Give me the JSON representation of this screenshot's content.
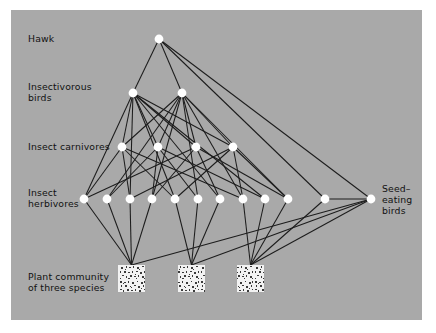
{
  "figure": {
    "type": "food-web-diagram",
    "background_color": "#a9a9a9",
    "page_background": "#ffffff",
    "node_color": "#ffffff",
    "edge_color": "#1c1c1c",
    "text_color": "#111111"
  },
  "labels": {
    "hawk": "Hawk",
    "insectivorous_birds_line1": "Insectivorous",
    "insectivorous_birds_line2": "birds",
    "insect_carnivores": "Insect carnivores",
    "insect_herbivores_line1": "Insect",
    "insect_herbivores_line2": "herbivores",
    "plant_community_line1": "Plant community",
    "plant_community_line2": "of three species",
    "seed_eating_birds_line1": "Seed–",
    "seed_eating_birds_line2": "eating",
    "seed_eating_birds_line3": "birds"
  },
  "trophic_levels": [
    {
      "id": "hawk",
      "label": "Hawk",
      "node_count": 1,
      "y": 29
    },
    {
      "id": "insectivorous-birds",
      "label": "Insectivorous birds",
      "node_count": 2,
      "y": 83
    },
    {
      "id": "insect-carnivores",
      "label": "Insect carnivores",
      "node_count": 4,
      "y": 137
    },
    {
      "id": "insect-herbivores",
      "label": "Insect herbivores",
      "node_count": 12,
      "y": 189
    },
    {
      "id": "seed-eating-birds",
      "label": "Seed-eating birds",
      "node_count": 1,
      "y": 189
    },
    {
      "id": "plant-community",
      "label": "Plant community of three species",
      "node_count": 3,
      "y": 266
    }
  ],
  "nodes": {
    "hawk": [
      {
        "id": "H1",
        "x": 148,
        "y": 29
      }
    ],
    "insectivorous_birds": [
      {
        "id": "IB1",
        "x": 122,
        "y": 83
      },
      {
        "id": "IB2",
        "x": 171,
        "y": 83
      }
    ],
    "insect_carnivores": [
      {
        "id": "C1",
        "x": 111,
        "y": 137
      },
      {
        "id": "C2",
        "x": 147,
        "y": 137
      },
      {
        "id": "C3",
        "x": 185,
        "y": 137
      },
      {
        "id": "C4",
        "x": 222,
        "y": 137
      }
    ],
    "insect_herbivores": [
      {
        "id": "Hb1",
        "x": 73,
        "y": 189
      },
      {
        "id": "Hb2",
        "x": 96,
        "y": 189
      },
      {
        "id": "Hb3",
        "x": 119,
        "y": 189
      },
      {
        "id": "Hb4",
        "x": 141,
        "y": 189
      },
      {
        "id": "Hb5",
        "x": 164,
        "y": 189
      },
      {
        "id": "Hb6",
        "x": 187,
        "y": 189
      },
      {
        "id": "Hb7",
        "x": 209,
        "y": 189
      },
      {
        "id": "Hb8",
        "x": 232,
        "y": 189
      },
      {
        "id": "Hb9",
        "x": 254,
        "y": 189
      },
      {
        "id": "Hb10",
        "x": 277,
        "y": 189
      },
      {
        "id": "Hb11",
        "x": 314,
        "y": 189
      }
    ],
    "seed_eating_birds": [
      {
        "id": "SB1",
        "x": 360,
        "y": 189
      }
    ],
    "plant_patches": [
      {
        "id": "P1",
        "x": 107,
        "y": 255,
        "width": 27,
        "height": 27
      },
      {
        "id": "P2",
        "x": 167,
        "y": 255,
        "width": 27,
        "height": 27
      },
      {
        "id": "P3",
        "x": 226,
        "y": 255,
        "width": 27,
        "height": 27
      }
    ]
  },
  "edges": {
    "hawk_to_birds": [
      [
        "H1",
        "IB1"
      ],
      [
        "H1",
        "IB2"
      ]
    ],
    "hawk_to_others": [
      [
        "H1",
        "Hb11"
      ],
      [
        "H1",
        "SB1"
      ]
    ],
    "birds_to_carnivores": [
      [
        "IB1",
        "C1"
      ],
      [
        "IB1",
        "C2"
      ],
      [
        "IB1",
        "C3"
      ],
      [
        "IB1",
        "C4"
      ],
      [
        "IB2",
        "C1"
      ],
      [
        "IB2",
        "C2"
      ],
      [
        "IB2",
        "C3"
      ],
      [
        "IB2",
        "C4"
      ]
    ],
    "birds_to_herbivores": [
      [
        "IB1",
        "Hb1"
      ],
      [
        "IB1",
        "Hb3"
      ],
      [
        "IB1",
        "Hb5"
      ],
      [
        "IB1",
        "Hb7"
      ],
      [
        "IB1",
        "Hb9"
      ],
      [
        "IB2",
        "Hb2"
      ],
      [
        "IB2",
        "Hb4"
      ],
      [
        "IB2",
        "Hb6"
      ],
      [
        "IB2",
        "Hb8"
      ],
      [
        "IB2",
        "Hb10"
      ]
    ],
    "carnivores_to_herbivores": [
      [
        "C1",
        "Hb1"
      ],
      [
        "C1",
        "Hb3"
      ],
      [
        "C1",
        "Hb5"
      ],
      [
        "C1",
        "Hb8"
      ],
      [
        "C2",
        "Hb2"
      ],
      [
        "C2",
        "Hb4"
      ],
      [
        "C2",
        "Hb6"
      ],
      [
        "C2",
        "Hb9"
      ],
      [
        "C3",
        "Hb1"
      ],
      [
        "C3",
        "Hb4"
      ],
      [
        "C3",
        "Hb7"
      ],
      [
        "C3",
        "Hb10"
      ],
      [
        "C4",
        "Hb3"
      ],
      [
        "C4",
        "Hb5"
      ],
      [
        "C4",
        "Hb8"
      ],
      [
        "C4",
        "Hb10"
      ]
    ],
    "herbivores_to_plants": [
      [
        "Hb1",
        "P1"
      ],
      [
        "Hb2",
        "P1"
      ],
      [
        "Hb3",
        "P1"
      ],
      [
        "Hb4",
        "P1"
      ],
      [
        "Hb5",
        "P2"
      ],
      [
        "Hb6",
        "P2"
      ],
      [
        "Hb7",
        "P2"
      ],
      [
        "Hb8",
        "P3"
      ],
      [
        "Hb9",
        "P3"
      ],
      [
        "Hb10",
        "P3"
      ],
      [
        "Hb11",
        "P3"
      ]
    ],
    "plants_to_seed_birds": [
      [
        "P1",
        "SB1"
      ],
      [
        "P2",
        "SB1"
      ],
      [
        "P3",
        "SB1"
      ]
    ],
    "herbivores_to_seed_birds": [
      [
        "Hb11",
        "SB1"
      ]
    ]
  }
}
